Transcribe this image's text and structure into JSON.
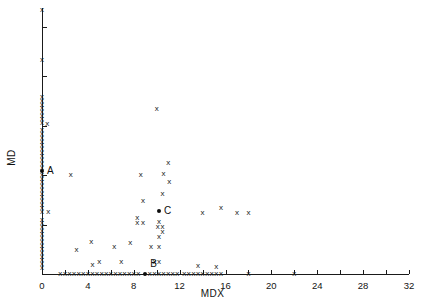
{
  "chart_data": {
    "type": "scatter",
    "title": "",
    "xlabel": "MDX",
    "ylabel": "MD",
    "xlim": [
      0,
      32
    ],
    "ylim": [
      0,
      21.5
    ],
    "grid": false,
    "legend": null,
    "xticks": [
      0,
      2,
      4,
      6,
      8,
      10,
      12,
      14,
      16,
      18,
      20,
      22,
      24,
      26,
      28,
      30,
      32
    ],
    "xticklabels": [
      {
        "value": 0,
        "text": "0"
      },
      {
        "value": 4,
        "text": "4"
      },
      {
        "value": 8,
        "text": "8"
      },
      {
        "value": 12,
        "text": "12"
      },
      {
        "value": 16,
        "text": "16"
      },
      {
        "value": 20,
        "text": "20"
      },
      {
        "value": 24,
        "text": "24"
      },
      {
        "value": 28,
        "text": "28"
      },
      {
        "value": 32,
        "text": "32"
      }
    ],
    "yticks": [
      0,
      4,
      8,
      12,
      16,
      20
    ],
    "yticklabels": [
      {
        "value": 0,
        "text": "0"
      },
      {
        "value": 4,
        "text": "4"
      },
      {
        "value": 8,
        "text": "8"
      },
      {
        "value": 12,
        "text": "12"
      },
      {
        "value": 16,
        "text": "16"
      },
      {
        "value": 20,
        "text": "20"
      }
    ],
    "marker": "x",
    "marker_color": "#1a1a1a",
    "points": [
      [
        0.0,
        21.3
      ],
      [
        0.0,
        17.3
      ],
      [
        0.0,
        14.3
      ],
      [
        0.0,
        14.0
      ],
      [
        0.0,
        13.7
      ],
      [
        0.0,
        13.4
      ],
      [
        0.0,
        13.1
      ],
      [
        0.0,
        12.8
      ],
      [
        0.0,
        12.5
      ],
      [
        0.0,
        12.2
      ],
      [
        0.45,
        12.1
      ],
      [
        0.0,
        11.6
      ],
      [
        0.0,
        11.3
      ],
      [
        0.0,
        11.0
      ],
      [
        0.0,
        10.7
      ],
      [
        0.0,
        10.4
      ],
      [
        0.0,
        10.1
      ],
      [
        0.0,
        9.8
      ],
      [
        0.0,
        9.5
      ],
      [
        0.0,
        9.2
      ],
      [
        0.0,
        8.9
      ],
      [
        0.0,
        8.6
      ],
      [
        0.0,
        8.0
      ],
      [
        0.0,
        7.7
      ],
      [
        0.0,
        7.4
      ],
      [
        0.0,
        7.1
      ],
      [
        0.0,
        6.8
      ],
      [
        0.0,
        6.5
      ],
      [
        0.0,
        6.2
      ],
      [
        0.0,
        5.9
      ],
      [
        0.0,
        5.6
      ],
      [
        0.0,
        5.3
      ],
      [
        0.0,
        5.0
      ],
      [
        0.55,
        5.0
      ],
      [
        0.0,
        4.4
      ],
      [
        0.0,
        4.1
      ],
      [
        0.0,
        3.8
      ],
      [
        0.0,
        3.5
      ],
      [
        0.0,
        3.2
      ],
      [
        0.0,
        2.9
      ],
      [
        0.0,
        2.6
      ],
      [
        0.0,
        2.3
      ],
      [
        0.0,
        2.0
      ],
      [
        0.0,
        1.7
      ],
      [
        0.0,
        1.4
      ],
      [
        0.0,
        1.1
      ],
      [
        0.0,
        0.8
      ],
      [
        0.0,
        0.5
      ],
      [
        1.6,
        0.0
      ],
      [
        2.0,
        0.0
      ],
      [
        2.4,
        0.0
      ],
      [
        2.8,
        0.0
      ],
      [
        3.2,
        0.0
      ],
      [
        3.6,
        0.0
      ],
      [
        4.0,
        0.0
      ],
      [
        4.4,
        0.0
      ],
      [
        4.4,
        0.75
      ],
      [
        4.8,
        0.0
      ],
      [
        5.2,
        0.0
      ],
      [
        5.6,
        0.0
      ],
      [
        6.0,
        0.0
      ],
      [
        6.4,
        0.0
      ],
      [
        6.8,
        0.0
      ],
      [
        7.2,
        0.0
      ],
      [
        7.6,
        0.0
      ],
      [
        8.0,
        0.0
      ],
      [
        8.4,
        0.0
      ],
      [
        9.4,
        0.0
      ],
      [
        9.8,
        0.0
      ],
      [
        10.2,
        0.0
      ],
      [
        10.6,
        0.0
      ],
      [
        11.0,
        0.0
      ],
      [
        11.4,
        0.0
      ],
      [
        11.8,
        0.0
      ],
      [
        12.4,
        0.0
      ],
      [
        12.8,
        0.0
      ],
      [
        13.2,
        0.0
      ],
      [
        13.6,
        0.65
      ],
      [
        13.6,
        0.0
      ],
      [
        14.0,
        0.0
      ],
      [
        14.4,
        0.0
      ],
      [
        14.8,
        0.0
      ],
      [
        15.2,
        0.0
      ],
      [
        15.2,
        0.55
      ],
      [
        15.6,
        0.0
      ],
      [
        18.0,
        0.0
      ],
      [
        22.0,
        0.0
      ],
      [
        2.5,
        8.0
      ],
      [
        3.0,
        1.9
      ],
      [
        4.3,
        2.6
      ],
      [
        5.0,
        1.0
      ],
      [
        6.3,
        2.2
      ],
      [
        6.9,
        1.0
      ],
      [
        7.7,
        2.5
      ],
      [
        8.3,
        4.5
      ],
      [
        8.3,
        4.1
      ],
      [
        8.8,
        4.1
      ],
      [
        8.8,
        5.9
      ],
      [
        8.6,
        8.0
      ],
      [
        9.5,
        2.2
      ],
      [
        9.8,
        1.0
      ],
      [
        10.2,
        4.2
      ],
      [
        10.1,
        3.8
      ],
      [
        10.5,
        3.8
      ],
      [
        10.5,
        3.4
      ],
      [
        10.2,
        3.0
      ],
      [
        10.2,
        2.2
      ],
      [
        10.2,
        1.0
      ],
      [
        10.0,
        13.3
      ],
      [
        10.5,
        6.5
      ],
      [
        10.6,
        8.1
      ],
      [
        11.1,
        7.4
      ],
      [
        11.0,
        9.0
      ],
      [
        14.0,
        4.9
      ],
      [
        15.6,
        5.3
      ],
      [
        17.0,
        4.9
      ],
      [
        18.0,
        4.9
      ]
    ],
    "highlighted_points": [
      {
        "label": "A",
        "x": 0.0,
        "y": 8.3
      },
      {
        "label": "B",
        "x": 9.0,
        "y": 0.0
      },
      {
        "label": "C",
        "x": 10.2,
        "y": 5.1
      }
    ]
  }
}
